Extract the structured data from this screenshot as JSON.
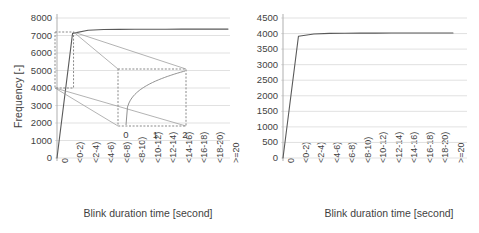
{
  "figure": {
    "panels": [
      "left",
      "right"
    ],
    "background_color": "#ffffff",
    "line_color": "#595959",
    "grid_color": "#d9d9d9",
    "axis_color": "#a6a6a6"
  },
  "chart_data": [
    {
      "id": "left",
      "type": "line",
      "title": "",
      "xlabel": "Blink duration time [second]",
      "ylabel": "Frequency [-]",
      "categories": [
        "0",
        "<0-2)",
        "<2-4)",
        "<4-6)",
        "<6-8)",
        "<8-10)",
        "<10-12)",
        "<12-14)",
        "<14-16)",
        "<16-18)",
        "<18-20)",
        ">=20"
      ],
      "values": [
        0,
        7120,
        7300,
        7340,
        7350,
        7355,
        7358,
        7360,
        7362,
        7364,
        7365,
        7366
      ],
      "yticks": [
        0,
        1000,
        2000,
        3000,
        4000,
        5000,
        6000,
        7000,
        8000
      ],
      "ylim": [
        0,
        8000
      ],
      "grid": true,
      "legend": false,
      "inset": {
        "xticks": [
          "0",
          "1",
          "2"
        ],
        "source_box": {
          "x_from": "0",
          "x_to": "<0-2)",
          "y_from": 4000,
          "y_to": 7200
        },
        "description": "magnified view of the steep initial rise"
      }
    },
    {
      "id": "right",
      "type": "line",
      "title": "",
      "xlabel": "Blink duration time [second]",
      "ylabel": "",
      "categories": [
        "0",
        "<0-2)",
        "<2-4)",
        "<4-6)",
        "<6-8)",
        "<8-10)",
        "<10-12)",
        "<12-14)",
        "<14-16)",
        "<16-18)",
        "<18-20)",
        ">=20"
      ],
      "values": [
        0,
        3915,
        3985,
        4005,
        4010,
        4013,
        4015,
        4016,
        4017,
        4018,
        4019,
        4020
      ],
      "yticks": [
        0,
        500,
        1000,
        1500,
        2000,
        2500,
        3000,
        3500,
        4000,
        4500
      ],
      "ylim": [
        0,
        4500
      ],
      "grid": true,
      "legend": false
    }
  ]
}
